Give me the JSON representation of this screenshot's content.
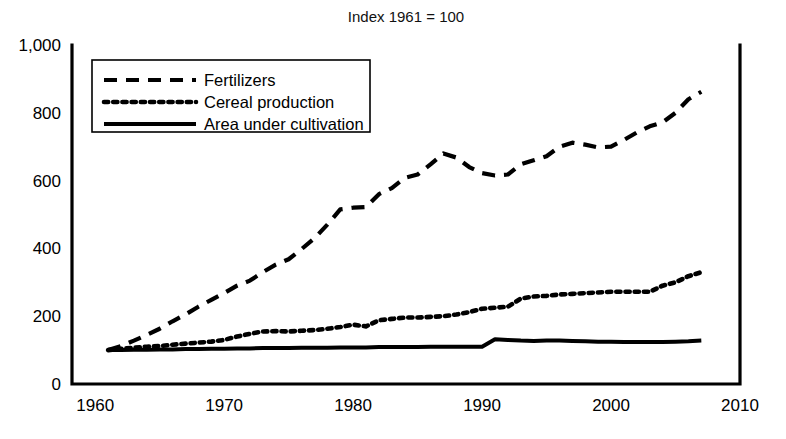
{
  "chart_data": {
    "type": "line",
    "title": "Index  1961 = 100",
    "xlabel": "",
    "ylabel": "",
    "xlim": [
      1958.2,
      2010
    ],
    "ylim": [
      0,
      1000
    ],
    "grid": false,
    "legend_position": "top-left",
    "x_ticks": [
      "1960",
      "1970",
      "1980",
      "1990",
      "2000",
      "2010"
    ],
    "x_tick_values": [
      1960,
      1970,
      1980,
      1990,
      2000,
      2010
    ],
    "y_ticks": [
      "0",
      "200",
      "400",
      "600",
      "800",
      "1,000"
    ],
    "y_tick_values": [
      0,
      200,
      400,
      600,
      800,
      1000
    ],
    "x": [
      1961,
      1962,
      1963,
      1964,
      1965,
      1966,
      1967,
      1968,
      1969,
      1970,
      1971,
      1972,
      1973,
      1974,
      1975,
      1976,
      1977,
      1978,
      1979,
      1980,
      1981,
      1982,
      1983,
      1984,
      1985,
      1986,
      1987,
      1988,
      1989,
      1990,
      1991,
      1992,
      1993,
      1994,
      1995,
      1996,
      1997,
      1998,
      1999,
      2000,
      2001,
      2002,
      2003,
      2004,
      2005,
      2006,
      2007
    ],
    "series": [
      {
        "name": "Fertilizers",
        "style": "dashed",
        "values": [
          100,
          112,
          128,
          145,
          163,
          185,
          205,
          228,
          248,
          268,
          290,
          305,
          330,
          352,
          368,
          398,
          430,
          470,
          515,
          520,
          522,
          560,
          578,
          608,
          618,
          648,
          680,
          668,
          640,
          622,
          615,
          618,
          648,
          660,
          672,
          700,
          712,
          706,
          698,
          700,
          720,
          742,
          760,
          772,
          800,
          840,
          862
        ]
      },
      {
        "name": "Cereal production",
        "style": "dotted",
        "values": [
          100,
          104,
          107,
          110,
          112,
          116,
          119,
          122,
          125,
          130,
          140,
          148,
          155,
          156,
          155,
          157,
          159,
          163,
          168,
          175,
          170,
          188,
          192,
          196,
          196,
          198,
          200,
          205,
          212,
          222,
          225,
          228,
          252,
          258,
          260,
          264,
          266,
          268,
          270,
          272,
          272,
          272,
          272,
          290,
          300,
          318,
          330
        ]
      },
      {
        "name": "Area under cultivation",
        "style": "solid",
        "values": [
          100,
          100,
          101,
          101,
          102,
          102,
          103,
          103,
          104,
          104,
          105,
          105,
          106,
          106,
          106,
          107,
          107,
          107,
          108,
          108,
          108,
          109,
          109,
          109,
          109,
          110,
          110,
          110,
          110,
          110,
          132,
          130,
          128,
          127,
          128,
          128,
          127,
          126,
          125,
          125,
          124,
          124,
          124,
          124,
          125,
          126,
          128
        ]
      }
    ],
    "legend_entries": [
      "Fertilizers",
      "Cereal production",
      "Area under cultivation"
    ]
  },
  "colors": {
    "ink": "#000000",
    "paper": "#ffffff"
  }
}
